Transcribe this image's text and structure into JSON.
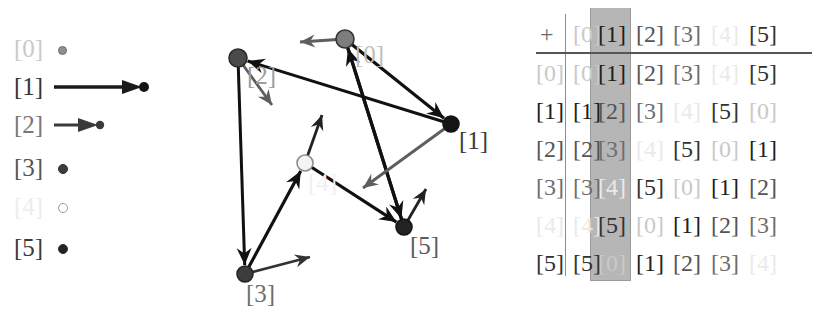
{
  "legend": {
    "rows": [
      {
        "label": "[0]",
        "color": "#8e8e8e",
        "kind": "dot-small",
        "label_color": "#c9c9c9"
      },
      {
        "label": "[1]",
        "color": "#1a1a1a",
        "kind": "arrow-long",
        "label_color": "#333333"
      },
      {
        "label": "[2]",
        "color": "#3a3a3a",
        "kind": "arrow-short",
        "label_color": "#777777"
      },
      {
        "label": "[3]",
        "color": "#3d3d3d",
        "kind": "dot-med",
        "label_color": "#555555"
      },
      {
        "label": "[4]",
        "color": "#ffffff",
        "kind": "dot-open",
        "label_color": "#ededed"
      },
      {
        "label": "[5]",
        "color": "#242424",
        "kind": "dot-med",
        "label_color": "#3a3a3a"
      }
    ]
  },
  "graph": {
    "type": "cayley-graph",
    "nodes": [
      {
        "id": "0",
        "label": "[0]",
        "x": 345,
        "y": 39,
        "r": 9,
        "fill": "#7d7d7d",
        "stroke": "#333333",
        "label_x": 355,
        "label_y": 42,
        "label_color": "#bdbdbd"
      },
      {
        "id": "1",
        "label": "[1]",
        "x": 451,
        "y": 124,
        "r": 8,
        "fill": "#141414",
        "stroke": "#141414",
        "label_x": 459,
        "label_y": 128,
        "label_color": "#3b3b3b"
      },
      {
        "id": "2",
        "label": "[2]",
        "x": 238,
        "y": 58,
        "r": 9,
        "fill": "#4a4a4a",
        "stroke": "#2a2a2a",
        "label_x": 247,
        "label_y": 63,
        "label_color": "#9d9d9d"
      },
      {
        "id": "3",
        "label": "[3]",
        "x": 245,
        "y": 274,
        "r": 8,
        "fill": "#3d3d3d",
        "stroke": "#242424",
        "label_x": 246,
        "label_y": 281,
        "label_color": "#6e6e6e"
      },
      {
        "id": "4",
        "label": "[4]",
        "x": 305,
        "y": 163,
        "r": 8,
        "fill": "#f4f4f4",
        "stroke": "#8d8d8d",
        "label_x": 308,
        "label_y": 170,
        "label_color": "#f0f0f0"
      },
      {
        "id": "5",
        "label": "[5]",
        "x": 404,
        "y": 227,
        "r": 8,
        "fill": "#232323",
        "stroke": "#141414",
        "label_x": 410,
        "label_y": 233,
        "label_color": "#5b5b5b"
      }
    ],
    "edges": [
      {
        "from": "0",
        "to": "1",
        "color": "#111111",
        "width": 3.2
      },
      {
        "from": "0",
        "to": "5",
        "color": "#111111",
        "width": 3.2
      },
      {
        "from": "2",
        "to": "3",
        "color": "#111111",
        "width": 3.0
      },
      {
        "from": "3",
        "to": "4",
        "color": "#111111",
        "width": 3.2
      },
      {
        "from": "4",
        "to": "5",
        "color": "#111111",
        "width": 3.2
      },
      {
        "from": "5",
        "to": "0",
        "color": "#111111",
        "width": 3.2
      },
      {
        "from": "1",
        "to": "2",
        "color": "#111111",
        "width": 3.0
      }
    ],
    "vectors": [
      {
        "at": "0",
        "dx": -45,
        "dy": 3,
        "color": "#5e5e5e",
        "width": 3.0
      },
      {
        "at": "1",
        "dx": -88,
        "dy": 64,
        "color": "#5e5e5e",
        "width": 2.8
      },
      {
        "at": "2",
        "dx": 34,
        "dy": 47,
        "color": "#5e5e5e",
        "width": 2.8
      },
      {
        "at": "3",
        "dx": 65,
        "dy": -17,
        "color": "#333333",
        "width": 2.6
      },
      {
        "at": "4",
        "dx": 17,
        "dy": -48,
        "color": "#222222",
        "width": 2.8
      },
      {
        "at": "5",
        "dx": 22,
        "dy": -38,
        "color": "#222222",
        "width": 2.8
      }
    ]
  },
  "table": {
    "operator": "+",
    "col_headers": [
      "[0]",
      "[1]",
      "[2]",
      "[3]",
      "[4]",
      "[5]"
    ],
    "row_headers": [
      "[0]",
      "[1]",
      "[2]",
      "[3]",
      "[4]",
      "[5]"
    ],
    "highlight_column_index": 1,
    "value_colors": {
      "[0]": "#c9c9c9",
      "[1]": "#1f1f1f",
      "[2]": "#555555",
      "[3]": "#6e6e6e",
      "[4]": "#eaeaea",
      "[5]": "#323232"
    },
    "rows": [
      [
        "[0]",
        "[1]",
        "[2]",
        "[3]",
        "[4]",
        "[5]"
      ],
      [
        "[1]",
        "[2]",
        "[3]",
        "[4]",
        "[5]",
        "[0]"
      ],
      [
        "[2]",
        "[3]",
        "[4]",
        "[5]",
        "[0]",
        "[1]"
      ],
      [
        "[3]",
        "[4]",
        "[5]",
        "[0]",
        "[1]",
        "[2]"
      ],
      [
        "[4]",
        "[5]",
        "[0]",
        "[1]",
        "[2]",
        "[3]"
      ],
      [
        "[5]",
        "[0]",
        "[1]",
        "[2]",
        "[3]",
        "[4]"
      ]
    ],
    "col_x": [
      8,
      45,
      70,
      108,
      145,
      183,
      221
    ],
    "row_y": [
      18,
      57,
      95,
      133,
      171,
      209,
      247
    ]
  }
}
